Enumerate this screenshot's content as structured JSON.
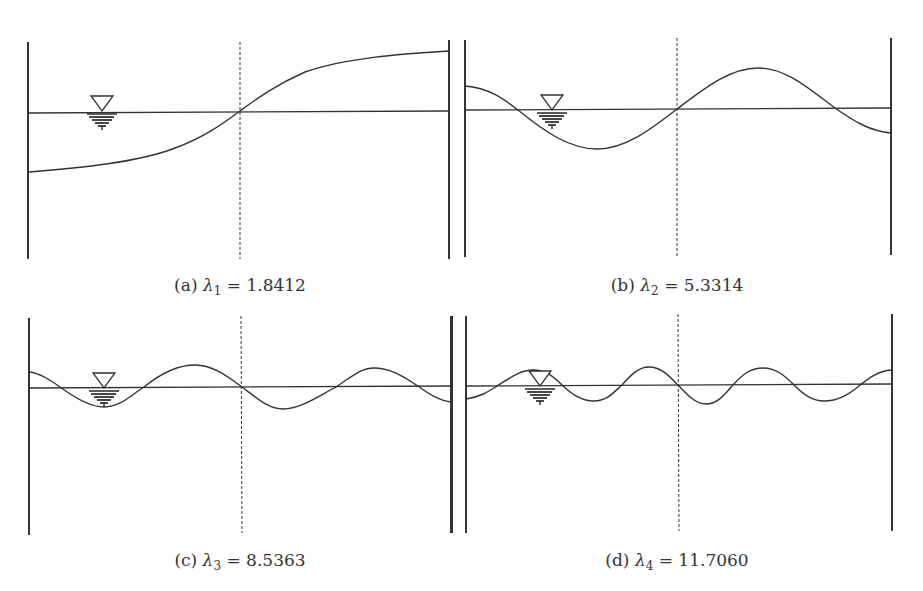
{
  "figure": {
    "panels": [
      {
        "id": "a",
        "tag": "(a)",
        "symbol": "λ",
        "subscript": "1",
        "equals": "=",
        "value": "1.8412",
        "mode_number": 1,
        "eigenvalue": 1.8412
      },
      {
        "id": "b",
        "tag": "(b)",
        "symbol": "λ",
        "subscript": "2",
        "equals": "=",
        "value": "5.3314",
        "mode_number": 2,
        "eigenvalue": 5.3314
      },
      {
        "id": "c",
        "tag": "(c)",
        "symbol": "λ",
        "subscript": "3",
        "equals": "=",
        "value": "8.5363",
        "mode_number": 3,
        "eigenvalue": 8.5363
      },
      {
        "id": "d",
        "tag": "(d)",
        "symbol": "λ",
        "subscript": "4",
        "equals": "=",
        "value": "11.7060",
        "mode_number": 4,
        "eigenvalue": 11.706
      }
    ],
    "icons": {
      "water_level": "inverted-triangle-water-surface-symbol"
    },
    "colors": {
      "line": "#333333",
      "background": "#ffffff",
      "text": "#333333"
    }
  }
}
